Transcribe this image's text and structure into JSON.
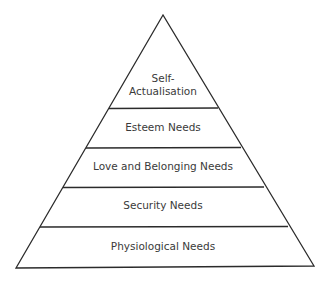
{
  "diagram": {
    "type": "pyramid",
    "line_color": "#2b2b2b",
    "text_color": "#3a3a3a",
    "levels": [
      {
        "label_line1": "Self-",
        "label_line2": "Actualisation"
      },
      {
        "label": "Esteem Needs"
      },
      {
        "label": "Love and Belonging Needs"
      },
      {
        "label": "Security Needs"
      },
      {
        "label": "Physiological Needs"
      }
    ]
  }
}
